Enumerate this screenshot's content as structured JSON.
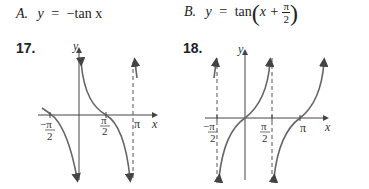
{
  "choices": [
    {
      "label": "A.",
      "y": "y",
      "eq": "=",
      "expr": "−tan x"
    },
    {
      "label": "B.",
      "y": "y",
      "eq": "=",
      "func": "tan",
      "inner": "x +",
      "frac_num": "π",
      "frac_den": "2"
    }
  ],
  "problems": [
    {
      "number": "17.",
      "x_axis_label": "x",
      "y_axis_label": "y",
      "ticks": [
        "−π/2",
        "π/2",
        "π"
      ]
    },
    {
      "number": "18.",
      "x_axis_label": "x",
      "y_axis_label": "y",
      "ticks": [
        "−π/2",
        "π/2",
        "π"
      ]
    }
  ],
  "tick_text": {
    "neg": "−",
    "pi": "π",
    "two": "2"
  }
}
